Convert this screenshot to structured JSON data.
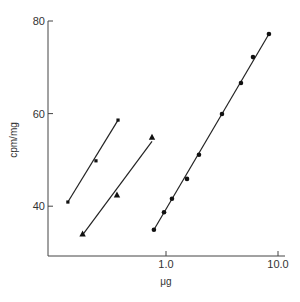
{
  "chart_data": {
    "type": "scatter",
    "title": "",
    "xlabel": "μg",
    "ylabel": "cpm/mg",
    "x_scale": "log",
    "xlim": [
      0.1,
      12
    ],
    "ylim": [
      29,
      80
    ],
    "x_ticks": [
      {
        "value": 1.0,
        "label": "1.0"
      },
      {
        "value": 10.0,
        "label": "10.0"
      }
    ],
    "y_ticks": [
      {
        "value": 40,
        "label": "40"
      },
      {
        "value": 60,
        "label": "60"
      },
      {
        "value": 80,
        "label": "80"
      }
    ],
    "grid": false,
    "legend": "none",
    "series": [
      {
        "name": "squares",
        "marker": "square",
        "x": [
          0.133,
          0.237,
          0.373
        ],
        "y": [
          40.9,
          49.8,
          58.6
        ],
        "fit_line": [
          [
            0.133,
            40.9
          ],
          [
            0.373,
            58.6
          ]
        ]
      },
      {
        "name": "triangles",
        "marker": "triangle",
        "x": [
          0.18,
          0.365,
          0.75
        ],
        "y": [
          34.0,
          42.4,
          54.9
        ],
        "fit_line": [
          [
            0.18,
            33.8
          ],
          [
            0.75,
            54.0
          ]
        ]
      },
      {
        "name": "circles",
        "marker": "circle",
        "x": [
          0.78,
          0.96,
          1.13,
          1.54,
          1.97,
          3.16,
          4.67,
          5.98,
          8.3
        ],
        "y": [
          34.9,
          38.7,
          41.6,
          45.9,
          51.1,
          59.9,
          66.6,
          72.2,
          77.2
        ],
        "fit_line": [
          [
            0.78,
            34.9
          ],
          [
            8.3,
            77.2
          ]
        ]
      }
    ]
  }
}
